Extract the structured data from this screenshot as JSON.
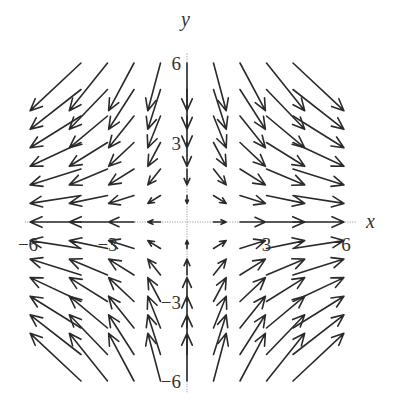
{
  "chart_data": {
    "type": "vector_field",
    "title": "",
    "xlabel": "x",
    "ylabel": "y",
    "xlim": [
      -6.5,
      6.5
    ],
    "ylim": [
      -6.5,
      6.5
    ],
    "x_ticks": [
      {
        "value": -6,
        "label": "−6"
      },
      {
        "value": -3,
        "label": "−3"
      },
      {
        "value": 3,
        "label": "3"
      },
      {
        "value": 6,
        "label": "6"
      }
    ],
    "y_ticks": [
      {
        "value": 6,
        "label": "6"
      },
      {
        "value": 3,
        "label": "3"
      },
      {
        "value": -3,
        "label": "−3"
      },
      {
        "value": -6,
        "label": "−6"
      }
    ],
    "grid": false,
    "field": {
      "description": "Saddle field: outward along x, inward along y; arrows drawn from grid points",
      "grid_x": [
        -4,
        -3,
        -2,
        -1,
        0,
        1,
        2,
        3,
        4
      ],
      "grid_y": [
        -6,
        -5,
        -4,
        -3,
        -2,
        -1,
        0,
        1,
        2,
        3,
        4,
        5,
        6
      ],
      "dx_per_x": 0.48,
      "dy_per_y": -0.3
    }
  },
  "layout": {
    "origin_px": [
      187,
      222
    ],
    "unit_px": 26.5,
    "arrow_color": "#2a2a2a"
  }
}
